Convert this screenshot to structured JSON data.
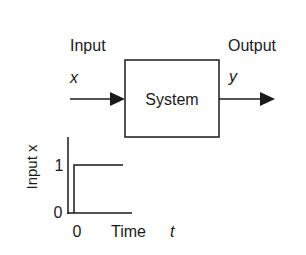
{
  "block_diagram": {
    "input_label": "Input",
    "input_symbol": "x",
    "output_label": "Output",
    "output_symbol": "y",
    "system_label": "System"
  },
  "step_plot": {
    "ylabel": "Input x",
    "xlabel": "Time",
    "xlabel_symbol": "t",
    "y_ticks": [
      "1",
      "0"
    ],
    "x_ticks": [
      "0"
    ]
  },
  "colors": {
    "stroke": "#1a1a1a",
    "background": "#ffffff"
  }
}
